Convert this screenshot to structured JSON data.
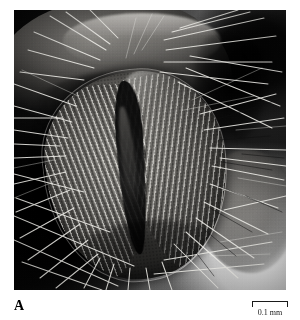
{
  "figure": {
    "panel_label": "A",
    "modality": "scanning-electron-micrograph",
    "background_color": "#ffffff"
  },
  "micrograph": {
    "alt_text": "Scanning electron micrograph of an insect labellum showing a teardrop-shaped lobe covered in parallel pseudotracheal ridges, a dark median oral groove, and numerous bright bristles radiating outward against a dark background",
    "dark_tone": "#050505",
    "mid_tone": "#8a8883",
    "light_tone": "#f2f2f0"
  },
  "scalebar": {
    "label": "0.1 mm",
    "length_value": "0.1",
    "length_unit": "mm",
    "bracket_style": "end-ticks-down"
  },
  "bristles": {
    "stroke_light": "#f0efea",
    "stroke_dark": "#0d0d0d"
  }
}
